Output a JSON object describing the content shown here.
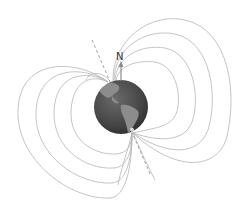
{
  "diagram": {
    "north_label": "N",
    "colors": {
      "field_line": "#b5b5b5",
      "axis": "#9a9a9a",
      "earth_ocean": "#4a4a4a",
      "earth_land": "#8c8c8c",
      "arrow": "#8a8a8a",
      "label": "#333333"
    },
    "earth": {
      "cx": 121,
      "cy": 107,
      "r": 27
    },
    "axis_line": {
      "x1": 92,
      "y1": 40,
      "x2": 151,
      "y2": 176
    },
    "north_arrow": {
      "x": 121,
      "y_start": 80,
      "y_end": 63
    }
  }
}
